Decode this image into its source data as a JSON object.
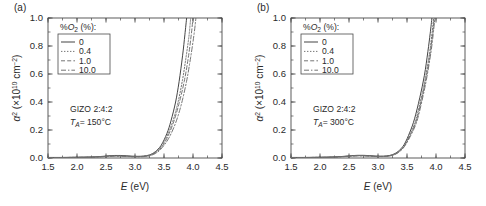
{
  "figure": {
    "panels": [
      {
        "id": "a",
        "label": "(a)",
        "annotation_material": "GIZO 2:4:2",
        "annotation_temp_prefix": "T",
        "annotation_temp_sub": "A",
        "annotation_temp_value": "= 150°C",
        "legend_title_pre": "%O",
        "legend_title_sub": "2",
        "legend_title_post": " (%):",
        "legend_items": [
          {
            "label": "0",
            "style": "solid",
            "color": "#3a3a3a"
          },
          {
            "label": "0.4",
            "style": "dotted",
            "color": "#6e6e6e"
          },
          {
            "label": "1.0",
            "style": "dashed",
            "color": "#6e6e6e"
          },
          {
            "label": "10.0",
            "style": "dashdot",
            "color": "#6e6e6e"
          }
        ]
      },
      {
        "id": "b",
        "label": "(b)",
        "annotation_material": "GIZO 2:4:2",
        "annotation_temp_prefix": "T",
        "annotation_temp_sub": "A",
        "annotation_temp_value": "= 300°C",
        "legend_title_pre": "%O",
        "legend_title_sub": "2",
        "legend_title_post": " (%):",
        "legend_items": [
          {
            "label": "0",
            "style": "solid",
            "color": "#3a3a3a"
          },
          {
            "label": "0.4",
            "style": "dotted",
            "color": "#6e6e6e"
          },
          {
            "label": "1.0",
            "style": "dashed",
            "color": "#6e6e6e"
          },
          {
            "label": "10.0",
            "style": "dashdot",
            "color": "#6e6e6e"
          }
        ]
      }
    ]
  },
  "chart_data": [
    {
      "type": "line",
      "panel": "a",
      "title": "",
      "xlabel_italic": "E",
      "xlabel_unit": " (eV)",
      "ylabel_symbol": "α",
      "ylabel_exp": "2",
      "ylabel_unit_pre": " (×10",
      "ylabel_unit_exp": "10",
      "ylabel_unit_post": " cm",
      "ylabel_unit_exp2": "−2",
      "ylabel_unit_close": ")",
      "xlim": [
        1.5,
        4.5
      ],
      "ylim": [
        0.0,
        1.0
      ],
      "xticks": [
        1.5,
        2.0,
        2.5,
        3.0,
        3.5,
        4.0,
        4.5
      ],
      "xticklabels": [
        "1.5",
        "2.0",
        "2.5",
        "3.0",
        "3.5",
        "4.0",
        "4.5"
      ],
      "yticks": [
        0.0,
        0.2,
        0.4,
        0.6,
        0.8,
        1.0
      ],
      "yticklabels": [
        "0.0",
        "0.2",
        "0.4",
        "0.6",
        "0.8",
        "1.0"
      ],
      "xminor_step": 0.25,
      "yminor_step": 0.1,
      "grid": false,
      "legend_position": "upper-left",
      "annotations": [
        "GIZO 2:4:2",
        "TA = 150°C"
      ],
      "series": [
        {
          "name": "0",
          "style": "solid",
          "color": "#3a3a3a",
          "x": [
            1.5,
            1.7,
            1.9,
            2.1,
            2.3,
            2.45,
            2.55,
            2.65,
            2.75,
            2.85,
            2.95,
            3.05,
            3.15,
            3.25,
            3.35,
            3.45,
            3.55,
            3.62,
            3.7,
            3.76,
            3.82,
            3.86,
            3.89
          ],
          "y": [
            0.004,
            0.004,
            0.005,
            0.006,
            0.008,
            0.012,
            0.016,
            0.018,
            0.018,
            0.016,
            0.013,
            0.012,
            0.014,
            0.022,
            0.045,
            0.09,
            0.175,
            0.265,
            0.4,
            0.545,
            0.73,
            0.88,
            1.0
          ]
        },
        {
          "name": "0.4",
          "style": "dotted",
          "color": "#6e6e6e",
          "x": [
            1.5,
            1.7,
            1.9,
            2.1,
            2.3,
            2.45,
            2.55,
            2.65,
            2.75,
            2.85,
            2.95,
            3.05,
            3.15,
            3.25,
            3.35,
            3.45,
            3.55,
            3.65,
            3.74,
            3.82,
            3.88,
            3.93,
            3.96
          ],
          "y": [
            0.003,
            0.003,
            0.004,
            0.005,
            0.007,
            0.01,
            0.013,
            0.015,
            0.015,
            0.013,
            0.011,
            0.01,
            0.012,
            0.02,
            0.04,
            0.08,
            0.155,
            0.26,
            0.395,
            0.56,
            0.72,
            0.87,
            1.0
          ]
        },
        {
          "name": "1.0",
          "style": "dashed",
          "color": "#6e6e6e",
          "x": [
            1.5,
            1.7,
            1.9,
            2.1,
            2.3,
            2.45,
            2.55,
            2.65,
            2.75,
            2.85,
            2.95,
            3.05,
            3.15,
            3.25,
            3.35,
            3.45,
            3.55,
            3.66,
            3.76,
            3.85,
            3.92,
            3.97,
            4.0
          ],
          "y": [
            0.003,
            0.003,
            0.004,
            0.005,
            0.007,
            0.01,
            0.013,
            0.014,
            0.014,
            0.012,
            0.01,
            0.01,
            0.011,
            0.018,
            0.036,
            0.072,
            0.14,
            0.25,
            0.39,
            0.55,
            0.72,
            0.88,
            1.0
          ]
        },
        {
          "name": "10.0",
          "style": "dashdot",
          "color": "#6e6e6e",
          "x": [
            1.5,
            1.7,
            1.9,
            2.1,
            2.3,
            2.45,
            2.55,
            2.65,
            2.75,
            2.85,
            2.95,
            3.05,
            3.15,
            3.25,
            3.35,
            3.45,
            3.58,
            3.7,
            3.8,
            3.89,
            3.96,
            4.02,
            4.05
          ],
          "y": [
            0.003,
            0.003,
            0.004,
            0.005,
            0.006,
            0.009,
            0.012,
            0.013,
            0.013,
            0.011,
            0.009,
            0.009,
            0.01,
            0.016,
            0.032,
            0.065,
            0.14,
            0.25,
            0.385,
            0.55,
            0.72,
            0.89,
            1.0
          ]
        }
      ]
    },
    {
      "type": "line",
      "panel": "b",
      "title": "",
      "xlabel_italic": "E",
      "xlabel_unit": " (eV)",
      "ylabel_symbol": "α",
      "ylabel_exp": "2",
      "ylabel_unit_pre": " (×10",
      "ylabel_unit_exp": "10",
      "ylabel_unit_post": " cm",
      "ylabel_unit_exp2": "−2",
      "ylabel_unit_close": ")",
      "xlim": [
        1.5,
        4.5
      ],
      "ylim": [
        0.0,
        1.0
      ],
      "xticks": [
        1.5,
        2.0,
        2.5,
        3.0,
        3.5,
        4.0,
        4.5
      ],
      "xticklabels": [
        "1.5",
        "2.0",
        "2.5",
        "3.0",
        "3.5",
        "4.0",
        "4.5"
      ],
      "yticks": [
        0.0,
        0.2,
        0.4,
        0.6,
        0.8,
        1.0
      ],
      "yticklabels": [
        "0.0",
        "0.2",
        "0.4",
        "0.6",
        "0.8",
        "1.0"
      ],
      "xminor_step": 0.25,
      "yminor_step": 0.1,
      "grid": false,
      "legend_position": "upper-left",
      "annotations": [
        "GIZO 2:4:2",
        "TA = 300°C"
      ],
      "series": [
        {
          "name": "0",
          "style": "solid",
          "color": "#3a3a3a",
          "x": [
            1.5,
            1.7,
            1.9,
            2.1,
            2.3,
            2.45,
            2.55,
            2.65,
            2.75,
            2.85,
            2.95,
            3.05,
            3.15,
            3.25,
            3.35,
            3.45,
            3.55,
            3.63,
            3.72,
            3.8,
            3.86,
            3.9,
            3.93
          ],
          "y": [
            0.004,
            0.004,
            0.005,
            0.006,
            0.009,
            0.013,
            0.017,
            0.019,
            0.019,
            0.017,
            0.014,
            0.013,
            0.015,
            0.024,
            0.048,
            0.095,
            0.185,
            0.28,
            0.43,
            0.59,
            0.76,
            0.89,
            1.0
          ]
        },
        {
          "name": "0.4",
          "style": "dotted",
          "color": "#6e6e6e",
          "x": [
            1.5,
            1.7,
            1.9,
            2.1,
            2.3,
            2.45,
            2.55,
            2.65,
            2.75,
            2.85,
            2.95,
            3.05,
            3.15,
            3.25,
            3.35,
            3.45,
            3.56,
            3.65,
            3.74,
            3.82,
            3.89,
            3.93,
            3.96
          ],
          "y": [
            0.003,
            0.003,
            0.004,
            0.005,
            0.008,
            0.012,
            0.015,
            0.017,
            0.017,
            0.015,
            0.012,
            0.011,
            0.013,
            0.021,
            0.043,
            0.086,
            0.175,
            0.27,
            0.42,
            0.58,
            0.755,
            0.885,
            1.0
          ]
        },
        {
          "name": "1.0",
          "style": "dashed",
          "color": "#6e6e6e",
          "x": [
            1.5,
            1.7,
            1.9,
            2.1,
            2.3,
            2.45,
            2.55,
            2.65,
            2.75,
            2.85,
            2.95,
            3.05,
            3.15,
            3.25,
            3.35,
            3.45,
            3.56,
            3.66,
            3.75,
            3.83,
            3.9,
            3.94,
            3.97
          ],
          "y": [
            0.003,
            0.003,
            0.004,
            0.005,
            0.008,
            0.011,
            0.014,
            0.016,
            0.016,
            0.014,
            0.011,
            0.011,
            0.012,
            0.02,
            0.041,
            0.082,
            0.168,
            0.265,
            0.415,
            0.575,
            0.75,
            0.88,
            1.0
          ]
        },
        {
          "name": "10.0",
          "style": "dashdot",
          "color": "#6e6e6e",
          "x": [
            1.5,
            1.7,
            1.9,
            2.1,
            2.3,
            2.45,
            2.55,
            2.65,
            2.75,
            2.85,
            2.95,
            3.05,
            3.15,
            3.25,
            3.35,
            3.45,
            3.57,
            3.67,
            3.76,
            3.84,
            3.91,
            3.95,
            3.98
          ],
          "y": [
            0.003,
            0.003,
            0.004,
            0.005,
            0.007,
            0.011,
            0.014,
            0.015,
            0.015,
            0.013,
            0.011,
            0.01,
            0.012,
            0.019,
            0.039,
            0.079,
            0.165,
            0.262,
            0.412,
            0.572,
            0.748,
            0.878,
            1.0
          ]
        }
      ]
    }
  ]
}
